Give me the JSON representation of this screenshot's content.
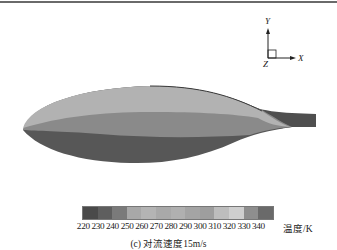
{
  "figure": {
    "caption": "(c) 对流速度15m/s",
    "axes": {
      "y_label": "Y",
      "x_label": "X",
      "z_label": "Z"
    },
    "colorbar": {
      "unit_label": "温度/K",
      "ticks": [
        "220",
        "230",
        "240",
        "250",
        "260",
        "270",
        "280",
        "290",
        "300",
        "310",
        "320",
        "330",
        "340"
      ],
      "colors": [
        "#4a4a4a",
        "#5e5e5e",
        "#7a7a7a",
        "#a8a8a8",
        "#b4b4b4",
        "#a9a9a9",
        "#b0b0b0",
        "#a4a4a4",
        "#9e9e9e",
        "#bdbdbd",
        "#cfcfcf",
        "#8e8e8e",
        "#6a6a6a",
        "#4e4e4e"
      ]
    },
    "shape_bands": {
      "top": "#b2b2b2",
      "middle": "#8a8a8a",
      "bottom": "#575757",
      "tail": "#4f4f4f"
    }
  }
}
